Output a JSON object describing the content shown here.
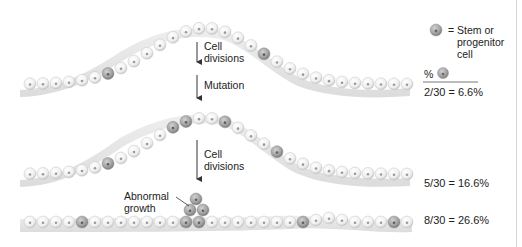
{
  "legend": {
    "symbol_label": "= Stem or progenitor cell",
    "line1": "= Stem or",
    "line2": "progenitor",
    "line3": "cell",
    "percent_symbol": "%"
  },
  "stages": [
    {
      "id": "stage-1",
      "ratio_label": "2/30 = 6.6%",
      "stem_cells": 2,
      "total_cells": 30,
      "percent": 6.6
    },
    {
      "id": "stage-2",
      "ratio_label": "5/30 = 16.6%",
      "stem_cells": 5,
      "total_cells": 30,
      "percent": 16.6
    },
    {
      "id": "stage-3",
      "ratio_label": "8/30 = 26.6%",
      "stem_cells": 8,
      "total_cells": 30,
      "percent": 26.6
    }
  ],
  "arrows": [
    {
      "label_line1": "Cell",
      "label_line2": "divisions"
    },
    {
      "label": "Mutation"
    },
    {
      "label_line1": "Cell",
      "label_line2": "divisions"
    }
  ],
  "annotation": {
    "line1": "Abnormal",
    "line2": "growth"
  },
  "colors": {
    "normal_cell": "#f4f4f4",
    "stem_cell": "#a8a8a8",
    "tissue": "#e6e6e6",
    "text": "#222222"
  }
}
